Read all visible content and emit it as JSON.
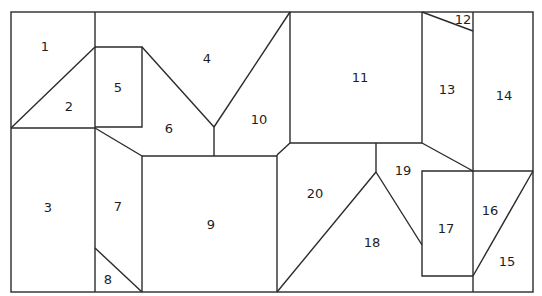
{
  "diagram": {
    "title": "",
    "line_color": "#2b2b2b",
    "background": "#ffffff",
    "regions": [
      {
        "id": "1",
        "label": "1",
        "x": 45,
        "y": 46
      },
      {
        "id": "2",
        "label": "2",
        "x": 69,
        "y": 106
      },
      {
        "id": "3",
        "label": "3",
        "x": 48,
        "y": 207
      },
      {
        "id": "4",
        "label": "4",
        "x": 207,
        "y": 58
      },
      {
        "id": "5",
        "label": "5",
        "x": 118,
        "y": 87
      },
      {
        "id": "6",
        "label": "6",
        "x": 169,
        "y": 128
      },
      {
        "id": "7",
        "label": "7",
        "x": 118,
        "y": 206
      },
      {
        "id": "8",
        "label": "8",
        "x": 108,
        "y": 279
      },
      {
        "id": "9",
        "label": "9",
        "x": 211,
        "y": 224
      },
      {
        "id": "10",
        "label": "10",
        "x": 259,
        "y": 119
      },
      {
        "id": "11",
        "label": "11",
        "x": 360,
        "y": 77
      },
      {
        "id": "12",
        "label": "12",
        "x": 463,
        "y": 19
      },
      {
        "id": "13",
        "label": "13",
        "x": 447,
        "y": 89
      },
      {
        "id": "14",
        "label": "14",
        "x": 504,
        "y": 95
      },
      {
        "id": "15",
        "label": "15",
        "x": 507,
        "y": 261
      },
      {
        "id": "16",
        "label": "16",
        "x": 490,
        "y": 210
      },
      {
        "id": "17",
        "label": "17",
        "x": 446,
        "y": 228
      },
      {
        "id": "18",
        "label": "18",
        "x": 372,
        "y": 242
      },
      {
        "id": "19",
        "label": "19",
        "x": 403,
        "y": 170
      },
      {
        "id": "20",
        "label": "20",
        "x": 315,
        "y": 193
      }
    ]
  }
}
